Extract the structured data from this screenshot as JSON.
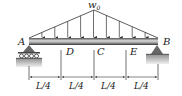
{
  "diagram": {
    "load_label": "w0",
    "load_label_main": "w",
    "load_label_sub": "0",
    "points": {
      "A": "A",
      "B": "B",
      "C": "C",
      "D": "D",
      "E": "E"
    },
    "segments": [
      "L/4",
      "L/4",
      "L/4",
      "L/4"
    ],
    "supports": {
      "A": "roller",
      "B": "pin"
    },
    "load_arrow_count": 9,
    "colors": {
      "beam_light": "#d9d9d9",
      "beam_dark": "#3a3a3a",
      "line": "#333333",
      "support": "#555555",
      "ground": "#9a9a9a"
    }
  }
}
